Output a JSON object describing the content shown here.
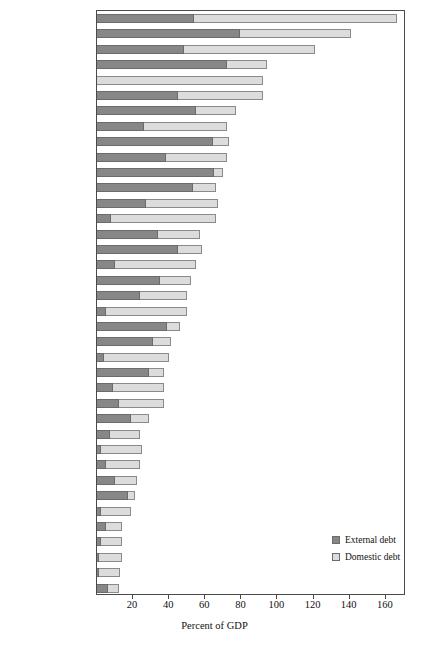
{
  "chart_data": {
    "type": "bar",
    "orientation": "horizontal",
    "stacked": true,
    "title": "",
    "xlabel": "Percent of GDP",
    "ylabel": "",
    "xlim": [
      0,
      169
    ],
    "xticks": [
      20,
      40,
      60,
      80,
      100,
      120,
      140,
      160
    ],
    "grid": false,
    "legend_position": "bottom-right",
    "legend": [
      "External debt",
      "Domestic debt"
    ],
    "categories": [
      "MENA-Lebanon",
      "ECA-Turkey",
      "LAC-Jamaica",
      "MENA-Jordan",
      "EAP-Singapore",
      "EAP-Indonesia",
      "LAC-Panama",
      "MENA-Morocco",
      "ECA-Bulgaria",
      "ECA-Georgia",
      "LAC-Honduras",
      "MENA-Yemen",
      "EAP-Philippines",
      "MENA-Egypt",
      "MENA-Algeria",
      "ECA-Moldova",
      "LAC-Brazil",
      "LAC-Uruguay",
      "LAC-Colombia",
      "ECA-Hungary",
      "ECA-Russia",
      "LAC-Peru",
      "EAP-Malaysia",
      "LAC-Argentina",
      "LAC-Costa Rica",
      "ECA-Poland",
      "ECA-Ukraine",
      "ECA-Slovenia",
      "ECA-Lithuania",
      "MENA-Tunisia",
      "EAP-Thailand",
      "LAC-Mexico",
      "LAC-Venezuela",
      "EAP-Korea",
      "LAC-Chile",
      "EAP-China",
      "ECA-Czech Republic",
      "ECA-Latvia"
    ],
    "series": [
      {
        "name": "External debt",
        "color": "#878787",
        "values": [
          54,
          79,
          48,
          72,
          0,
          45,
          55,
          26,
          64,
          38,
          65,
          53,
          27,
          8,
          34,
          45,
          10,
          35,
          24,
          5,
          39,
          31,
          4,
          29,
          9,
          12,
          19,
          7,
          2,
          5,
          10,
          17,
          2,
          5,
          2,
          1,
          1,
          6
        ]
      },
      {
        "name": "Domestic debt",
        "color": "#dcdcdc",
        "values": [
          112,
          62,
          73,
          22,
          92,
          47,
          22,
          46,
          9,
          34,
          5,
          13,
          40,
          58,
          23,
          13,
          45,
          17,
          26,
          45,
          7,
          10,
          36,
          8,
          28,
          25,
          10,
          17,
          23,
          19,
          12,
          4,
          17,
          9,
          12,
          13,
          12,
          6
        ]
      }
    ],
    "totals": [
      166,
      141,
      121,
      94,
      92,
      92,
      77,
      72,
      73,
      72,
      70,
      66,
      67,
      66,
      57,
      58,
      55,
      52,
      50,
      50,
      46,
      41,
      40,
      37,
      37,
      37,
      29,
      24,
      25,
      24,
      22,
      21,
      19,
      14,
      14,
      14,
      13,
      12
    ]
  },
  "axis": {
    "xlabel": "Percent of GDP",
    "tick_labels": [
      "20",
      "40",
      "60",
      "80",
      "100",
      "120",
      "140",
      "160"
    ]
  },
  "legend": {
    "items": [
      {
        "label": "External debt",
        "swatch": "external-debt-swatch"
      },
      {
        "label": "Domestic debt",
        "swatch": "domestic-debt-swatch"
      }
    ]
  }
}
